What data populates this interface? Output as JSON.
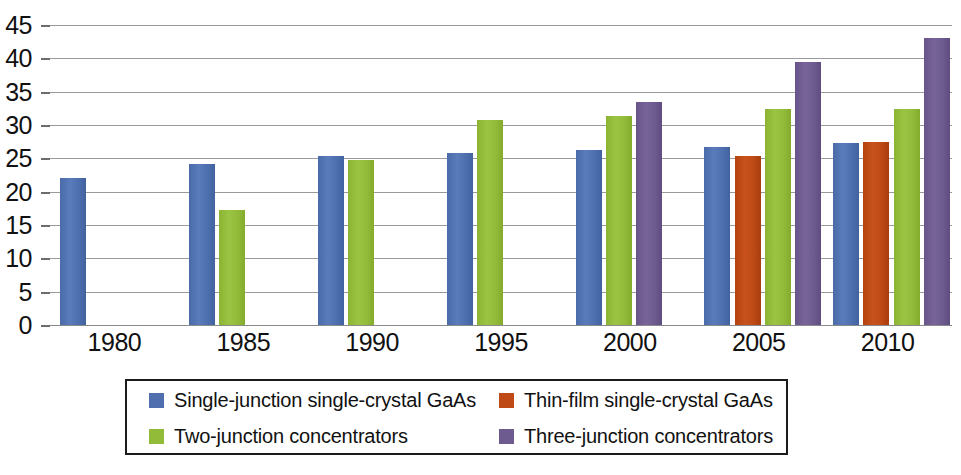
{
  "chart_data": {
    "type": "bar",
    "title": "",
    "xlabel": "",
    "ylabel": "",
    "categories": [
      "1980",
      "1985",
      "1990",
      "1995",
      "2000",
      "2005",
      "2010"
    ],
    "ylim": [
      0,
      45
    ],
    "ytick_step": 5,
    "yticks": [
      "45",
      "40",
      "35",
      "30",
      "25",
      "20",
      "15",
      "10",
      "5",
      "0"
    ],
    "grid": true,
    "legend_position": "bottom",
    "series": [
      {
        "name": "Single-junction single-crystal GaAs",
        "color": "#4f6fae",
        "values": [
          22.0,
          24.2,
          25.3,
          25.8,
          26.2,
          26.7,
          27.3
        ]
      },
      {
        "name": "Thin-film single-crystal GaAs",
        "color": "#bf4a16",
        "values": [
          null,
          null,
          null,
          null,
          null,
          25.4,
          27.4
        ]
      },
      {
        "name": "Two-junction concentrators",
        "color": "#93bb3a",
        "values": [
          null,
          17.2,
          24.8,
          30.8,
          31.4,
          32.4,
          32.4
        ]
      },
      {
        "name": "Three-junction concentrators",
        "color": "#6d5a8f",
        "values": [
          null,
          null,
          null,
          null,
          33.4,
          39.5,
          43.0
        ]
      }
    ]
  },
  "legend": {
    "items": [
      {
        "label": "Single-junction single-crystal GaAs",
        "color": "#4f6fae"
      },
      {
        "label": "Thin-film single-crystal GaAs",
        "color": "#bf4a16"
      },
      {
        "label": "Two-junction concentrators",
        "color": "#93bb3a"
      },
      {
        "label": "Three-junction concentrators",
        "color": "#6d5a8f"
      }
    ]
  },
  "axis": {
    "y_tick_labels": [
      "45",
      "40",
      "35",
      "30",
      "25",
      "20",
      "15",
      "10",
      "5",
      "0"
    ],
    "x_tick_labels": [
      "1980",
      "1985",
      "1990",
      "1995",
      "2000",
      "2005",
      "2010"
    ]
  }
}
